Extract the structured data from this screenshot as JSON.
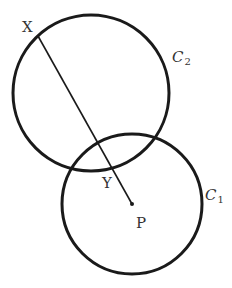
{
  "diagram": {
    "colors": {
      "stroke": "#1a1a1a",
      "label": "#333333",
      "background": "#ffffff"
    },
    "circles": [
      {
        "id": "C2",
        "cx": 91,
        "cy": 93,
        "r": 78
      },
      {
        "id": "C1",
        "cx": 132,
        "cy": 204,
        "r": 70
      }
    ],
    "segment": {
      "from": "X",
      "to": "P",
      "x1": 38,
      "y1": 36,
      "x2": 132,
      "y2": 204
    },
    "points": [
      {
        "name": "P",
        "x": 132,
        "y": 204
      }
    ],
    "labels": {
      "X": "X",
      "Y": "Y",
      "P": "P",
      "C1_main": "C",
      "C1_sub": "1",
      "C2_main": "C",
      "C2_sub": "2"
    }
  }
}
